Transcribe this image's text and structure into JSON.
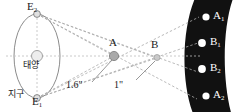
{
  "figure": {
    "type": "stellar-parallax-diagram",
    "background": "#ffffff",
    "sky_band_color": "#111111",
    "line_color": "#9a9a9a",
    "star_fill": "#ffffff",
    "sun_fill": "#e8e8e8"
  },
  "orbit": {
    "name": "earth-orbit-ellipse",
    "sun_label": "태양",
    "earth_label": "지구",
    "positions": [
      {
        "id": "E2",
        "letter": "E",
        "sub": "2",
        "role": "earth-position-top"
      },
      {
        "id": "E1",
        "letter": "E",
        "sub": "1",
        "role": "earth-position-bottom"
      }
    ]
  },
  "stars": [
    {
      "id": "A",
      "label": "A",
      "role": "near-star",
      "parallax": "1.6\""
    },
    {
      "id": "B",
      "label": "B",
      "role": "far-star",
      "parallax": "1\""
    }
  ],
  "angles": [
    {
      "id": "angle-a",
      "value": "1.6\"",
      "for_star": "A"
    },
    {
      "id": "angle-b",
      "value": "1\"",
      "for_star": "B"
    }
  ],
  "sky_points": [
    {
      "id": "A1",
      "letter": "A",
      "sub": "1",
      "order": 1
    },
    {
      "id": "B1",
      "letter": "B",
      "sub": "1",
      "order": 2
    },
    {
      "id": "B2",
      "letter": "B",
      "sub": "2",
      "order": 3
    },
    {
      "id": "A2",
      "letter": "A",
      "sub": "2",
      "order": 4
    }
  ]
}
